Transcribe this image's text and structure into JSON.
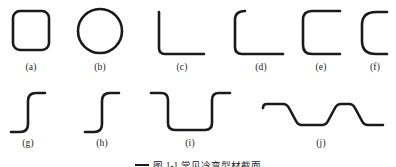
{
  "figure": {
    "stroke_color": "#1a1a1a",
    "background_color": "#ffffff",
    "stroke_width": 2.6,
    "caption": "图 1-1   常见冷弯型材截面",
    "rows": 2,
    "profile_count": 10
  },
  "labels": {
    "a": "(a)",
    "b": "(b)",
    "c": "(c)",
    "d": "(d)",
    "e": "(e)",
    "f": "(f)",
    "g": "(g)",
    "h": "(h)",
    "i": "(i)",
    "j": "(j)"
  },
  "profiles": [
    {
      "key": "a",
      "label": "(a)",
      "name": "rounded-rectangular-tube",
      "row": 1
    },
    {
      "key": "b",
      "label": "(b)",
      "name": "circular-tube",
      "row": 1
    },
    {
      "key": "c",
      "label": "(c)",
      "name": "angle-section",
      "row": 1
    },
    {
      "key": "d",
      "label": "(d)",
      "name": "lipped-angle-section",
      "row": 1
    },
    {
      "key": "e",
      "label": "(e)",
      "name": "channel-section",
      "row": 1
    },
    {
      "key": "f",
      "label": "(f)",
      "name": "lipped-channel-section",
      "row": 1
    },
    {
      "key": "g",
      "label": "(g)",
      "name": "z-section",
      "row": 2
    },
    {
      "key": "h",
      "label": "(h)",
      "name": "z-section-narrow",
      "row": 2
    },
    {
      "key": "i",
      "label": "(i)",
      "name": "hat-section",
      "row": 2
    },
    {
      "key": "j",
      "label": "(j)",
      "name": "corrugated-sheet",
      "row": 2
    }
  ]
}
